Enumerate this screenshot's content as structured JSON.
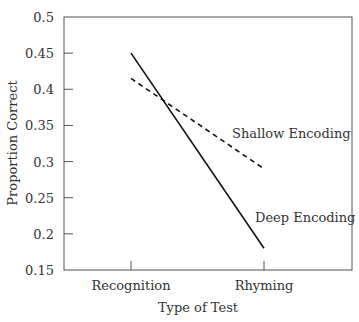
{
  "chart_data": {
    "type": "line",
    "title": "",
    "xlabel": "Type of Test",
    "ylabel": "Proportion Correct",
    "categories": [
      "Recognition",
      "Rhyming"
    ],
    "ylim": [
      0.15,
      0.5
    ],
    "yticks": [
      "0.15",
      "0.2",
      "0.25",
      "0.3",
      "0.35",
      "0.4",
      "0.45",
      "0.5"
    ],
    "grid": false,
    "legend": "inline labels",
    "series": [
      {
        "name": "Deep Encoding",
        "values": [
          0.45,
          0.18
        ],
        "style": "solid"
      },
      {
        "name": "Shallow Encoding",
        "values": [
          0.415,
          0.29
        ],
        "style": "dashed"
      }
    ]
  }
}
